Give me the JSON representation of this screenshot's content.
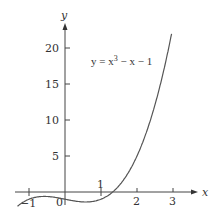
{
  "chart_data": {
    "type": "line",
    "title": "",
    "function": "y = x^3 - x - 1",
    "annotation": {
      "text_prefix": "y = x",
      "sup": "3",
      "text_suffix": " − x − 1"
    },
    "xlabel": "x",
    "ylabel": "y",
    "xlim": [
      -1.4,
      3.6
    ],
    "ylim": [
      -2.5,
      23
    ],
    "x_ticks": [
      -1,
      0,
      1,
      2,
      3
    ],
    "x_tick_labels": [
      "−1",
      "0",
      "1",
      "2",
      "3"
    ],
    "y_ticks": [
      5,
      10,
      15,
      20
    ],
    "y_tick_labels": [
      "5",
      "10",
      "15",
      "20"
    ],
    "grid": false,
    "legend": "none",
    "series": [
      {
        "name": "y = x^3 - x - 1",
        "x": [
          -1.3,
          -1.0,
          -0.58,
          0.0,
          0.58,
          1.0,
          1.32,
          1.5,
          2.0,
          2.5,
          2.95
        ],
        "values": [
          -1.897,
          -1.0,
          -0.615,
          -1.0,
          -1.385,
          -1.0,
          0.0,
          0.875,
          5.0,
          11.125,
          21.72
        ]
      }
    ],
    "colors": {
      "curve": "#555555",
      "axes": "#444444"
    }
  }
}
